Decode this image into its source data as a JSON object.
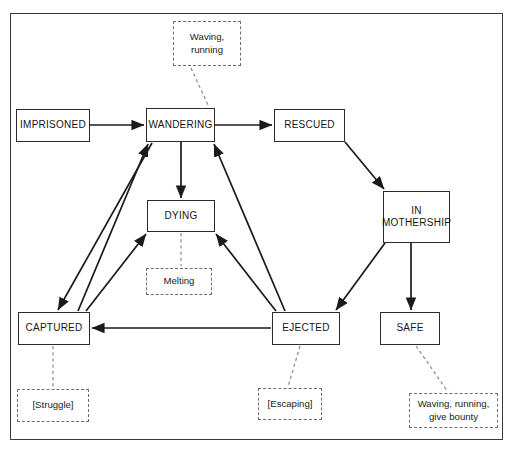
{
  "diagram": {
    "border_color": "#3a3a3a",
    "node_border_color": "#2b2b2b",
    "note_border_color": "#6d6d6d",
    "edge_color": "#1a1a1a",
    "nodes": [
      {
        "id": "imprisoned",
        "label": "IMPRISONED",
        "x": 16,
        "y": 109,
        "w": 74,
        "h": 33
      },
      {
        "id": "wandering",
        "label": "WANDERING",
        "x": 146,
        "y": 108,
        "w": 69,
        "h": 34
      },
      {
        "id": "rescued",
        "label": "RESCUED",
        "x": 274,
        "y": 109,
        "w": 71,
        "h": 33
      },
      {
        "id": "in-mothership",
        "label": "IN\nMOTHERSHIP",
        "x": 383,
        "y": 191,
        "w": 67,
        "h": 52
      },
      {
        "id": "dying",
        "label": "DYING",
        "x": 147,
        "y": 200,
        "w": 68,
        "h": 32
      },
      {
        "id": "captured",
        "label": "CAPTURED",
        "x": 18,
        "y": 312,
        "w": 72,
        "h": 33
      },
      {
        "id": "ejected",
        "label": "EJECTED",
        "x": 272,
        "y": 312,
        "w": 68,
        "h": 33
      },
      {
        "id": "safe",
        "label": "SAFE",
        "x": 380,
        "y": 312,
        "w": 60,
        "h": 33
      }
    ],
    "notes": [
      {
        "id": "note-wandering",
        "label": "Waving,\nrunning",
        "x": 173,
        "y": 21,
        "w": 68,
        "h": 45
      },
      {
        "id": "note-dying",
        "label": "Melting",
        "x": 146,
        "y": 268,
        "w": 66,
        "h": 27
      },
      {
        "id": "note-captured",
        "label": "[Struggle]",
        "x": 17,
        "y": 389,
        "w": 72,
        "h": 33
      },
      {
        "id": "note-ejected",
        "label": "[Escaping]",
        "x": 258,
        "y": 388,
        "w": 64,
        "h": 32
      },
      {
        "id": "note-safe",
        "label": "Waving, running,\ngive bounty",
        "x": 409,
        "y": 393,
        "w": 89,
        "h": 35
      }
    ],
    "transitions": [
      {
        "id": "imprisoned-to-wandering",
        "from": "IMPRISONED",
        "to": "WANDERING"
      },
      {
        "id": "wandering-to-rescued",
        "from": "WANDERING",
        "to": "RESCUED"
      },
      {
        "id": "wandering-to-dying",
        "from": "WANDERING",
        "to": "DYING"
      },
      {
        "id": "wandering-to-captured",
        "from": "WANDERING",
        "to": "CAPTURED"
      },
      {
        "id": "rescued-to-in-mothership",
        "from": "RESCUED",
        "to": "IN MOTHERSHIP"
      },
      {
        "id": "in-mothership-to-ejected",
        "from": "IN MOTHERSHIP",
        "to": "EJECTED"
      },
      {
        "id": "in-mothership-to-safe",
        "from": "IN MOTHERSHIP",
        "to": "SAFE"
      },
      {
        "id": "captured-to-dying",
        "from": "CAPTURED",
        "to": "DYING"
      },
      {
        "id": "captured-to-wandering",
        "from": "CAPTURED",
        "to": "WANDERING"
      },
      {
        "id": "ejected-to-dying",
        "from": "EJECTED",
        "to": "DYING"
      },
      {
        "id": "ejected-to-wandering",
        "from": "EJECTED",
        "to": "WANDERING"
      },
      {
        "id": "ejected-to-captured",
        "from": "EJECTED",
        "to": "CAPTURED"
      }
    ],
    "note_links": [
      {
        "id": "link-note-wandering",
        "note": "Waving,\nrunning",
        "node": "WANDERING"
      },
      {
        "id": "link-note-dying",
        "note": "Melting",
        "node": "DYING"
      },
      {
        "id": "link-note-captured",
        "note": "[Struggle]",
        "node": "CAPTURED"
      },
      {
        "id": "link-note-ejected",
        "note": "[Escaping]",
        "node": "EJECTED"
      },
      {
        "id": "link-note-safe",
        "note": "Waving, running,\ngive bounty",
        "node": "SAFE"
      }
    ]
  }
}
